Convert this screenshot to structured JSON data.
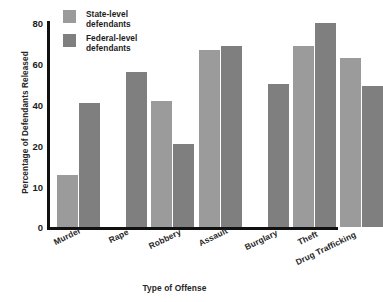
{
  "chart_data": {
    "type": "bar",
    "title": "",
    "xlabel": "Type of Offense",
    "ylabel": "Percentage of Defendants Released",
    "categories": [
      "Murder",
      "Rape",
      "Robbery",
      "Assault",
      "Burglary",
      "Theft",
      "Drug Trafficking"
    ],
    "series": [
      {
        "name": "State-level defendants",
        "color": "#9b9b9b",
        "values": [
          13,
          null,
          42,
          67,
          null,
          69,
          63
        ]
      },
      {
        "name": "Federal-level defendants",
        "color": "#7f7f7f",
        "values": [
          41,
          56,
          21,
          69,
          50,
          80,
          49
        ]
      }
    ],
    "yticks": [
      0,
      10,
      20,
      40,
      60,
      80
    ],
    "ylim": [
      0,
      80
    ],
    "grid": false,
    "legend_position": "top-left"
  },
  "axes": {
    "y_title": "Percentage of Defendants Released",
    "x_title": "Type of Offense",
    "y_ticks": [
      {
        "label": "80",
        "value": 80
      },
      {
        "label": "60",
        "value": 60
      },
      {
        "label": "40",
        "value": 40
      },
      {
        "label": "20",
        "value": 20
      },
      {
        "label": "10",
        "value": 10
      },
      {
        "label": "0",
        "value": 0
      }
    ]
  },
  "legend": {
    "items": [
      {
        "line1": "State-level",
        "line2": "defendants",
        "color": "#9b9b9b"
      },
      {
        "line1": "Federal-level",
        "line2": "defendants",
        "color": "#7f7f7f"
      }
    ]
  },
  "categories": [
    {
      "label": "Murder"
    },
    {
      "label": "Rape"
    },
    {
      "label": "Robbery"
    },
    {
      "label": "Assault"
    },
    {
      "label": "Burglary"
    },
    {
      "label": "Theft"
    },
    {
      "label": "Drug Trafficking"
    }
  ],
  "colors": {
    "state": "#9b9b9b",
    "federal": "#7f7f7f",
    "axis": "#111111",
    "text": "#1c1c1c",
    "background": "#ffffff"
  }
}
